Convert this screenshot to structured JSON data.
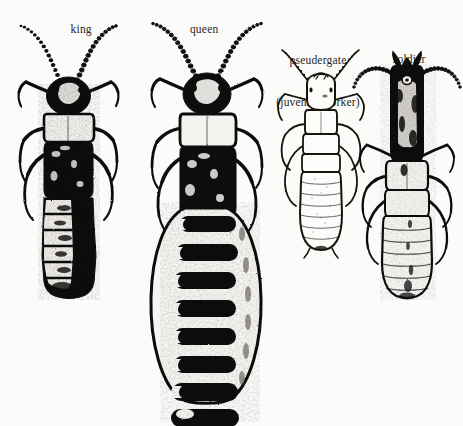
{
  "figure": {
    "background_color": "#fbfbf9",
    "ink_color": "#111111",
    "style": "scanned black-and-white scientific line engraving",
    "width": 463,
    "height": 426,
    "caption_font_size_px": 11.5
  },
  "labels": {
    "king": "king",
    "queen": "queen",
    "pseudergate_line1": "pseudergate",
    "pseudergate_line2": "(juvenile worker)",
    "soldier": "soldier"
  },
  "specimens": [
    {
      "id": "king",
      "label": "king",
      "label_x": 75,
      "label_y": 8,
      "body_x": 8,
      "body_y": 24,
      "body_w": 120,
      "body_h": 272,
      "rendering": "heavily inked dark body, pale thorax band, segmented abdomen",
      "abdomen_segments": 7,
      "antenna_segments": 17,
      "leg_pairs": 3,
      "has_wings": false,
      "shade": "dark"
    },
    {
      "id": "queen",
      "label": "queen",
      "label_x": 197,
      "label_y": 8,
      "body_x": 140,
      "body_y": 22,
      "body_w": 140,
      "body_h": 384,
      "rendering": "dark head and thorax with hugely swollen physogastric abdomen bearing dark tergal bands",
      "abdomen_segments": 9,
      "antenna_segments": 18,
      "leg_pairs": 3,
      "has_wings": false,
      "shade": "dark-head-pale-abdomen"
    },
    {
      "id": "pseudergate",
      "label": "pseudergate (juvenile worker)",
      "label_x": 318,
      "label_y": 26,
      "body_x": 272,
      "body_y": 50,
      "body_w": 96,
      "body_h": 212,
      "rendering": "pale unpigmented outline drawing, soft stipple shading",
      "abdomen_segments": 8,
      "antenna_segments": 12,
      "leg_pairs": 3,
      "has_wings": false,
      "shade": "pale"
    },
    {
      "id": "soldier",
      "label": "soldier",
      "label_x": 403,
      "label_y": 38,
      "body_x": 352,
      "body_y": 50,
      "body_w": 110,
      "body_h": 252,
      "rendering": "large elongated dark sclerotised head capsule with crossed mandibles, pale abdomen",
      "abdomen_segments": 8,
      "antenna_segments": 14,
      "leg_pairs": 3,
      "has_wings": false,
      "has_mandibles": true,
      "shade": "dark-head-pale-body"
    }
  ]
}
